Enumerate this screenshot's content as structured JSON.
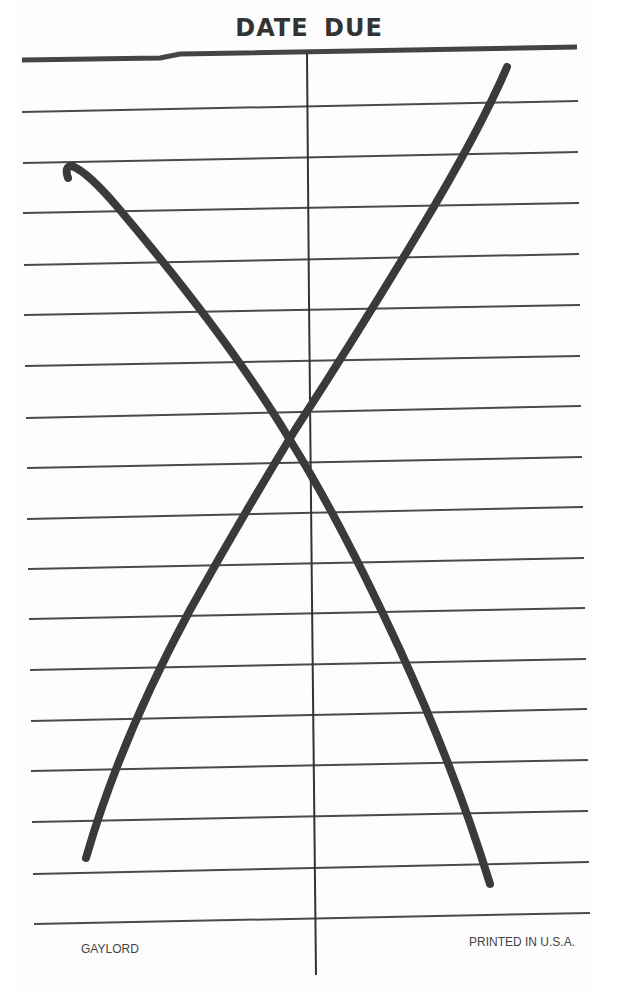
{
  "card": {
    "title": "DATE DUE",
    "footer_left": "GAYLORD",
    "footer_right": "PRINTED IN U.S.A.",
    "ruled_rows": 17,
    "columns": 2,
    "cancellation_mark": "X",
    "colors": {
      "ink": "#3a3a3a",
      "rule": "#444444",
      "paper": "#fdfdfd"
    }
  }
}
